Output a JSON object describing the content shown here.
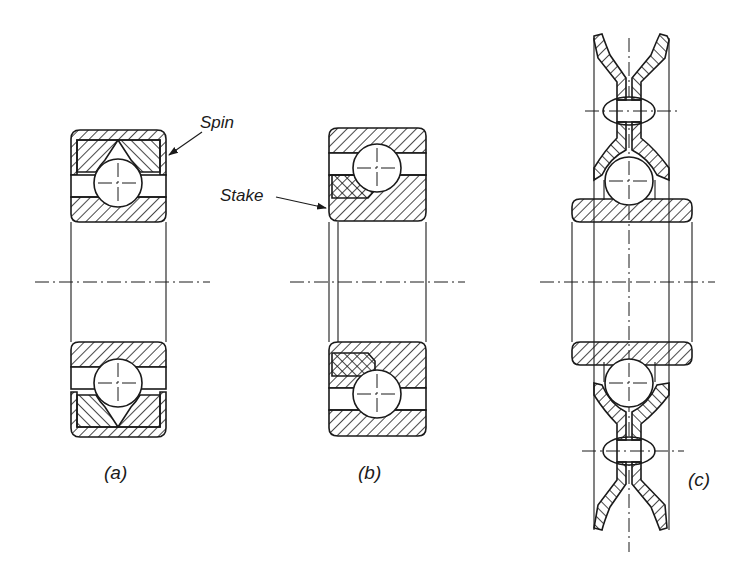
{
  "figure": {
    "colors": {
      "ink": "#1a1a1a",
      "background": "#ffffff"
    },
    "panels": [
      {
        "id": "a",
        "caption": "(a)",
        "annotation": "Spin"
      },
      {
        "id": "b",
        "caption": "(b)",
        "annotation": "Stake"
      },
      {
        "id": "c",
        "caption": "(c)",
        "annotation": ""
      }
    ]
  }
}
